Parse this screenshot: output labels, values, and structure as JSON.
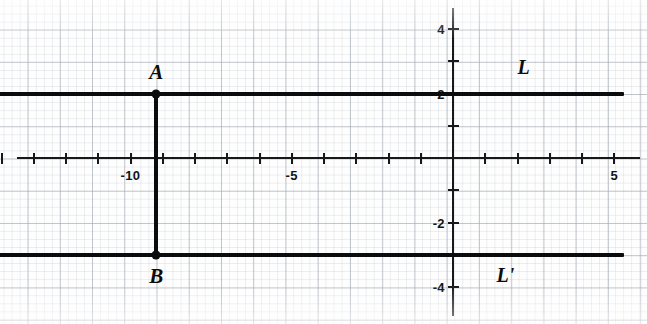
{
  "chart_data": {
    "type": "scatter",
    "title": "",
    "xlabel": "",
    "ylabel": "",
    "xlim": [
      -14.5,
      5.8
    ],
    "ylim": [
      -4.7,
      4.7
    ],
    "grid": true,
    "legend": "none",
    "axis": {
      "x_ticks": [
        -14,
        -13,
        -12,
        -11,
        -10,
        -9,
        -8,
        -7,
        -6,
        -5,
        -4,
        -3,
        -2,
        -1,
        0,
        1,
        2,
        3,
        4,
        5
      ],
      "y_ticks": [
        4,
        3,
        2,
        1,
        0,
        -1,
        -2,
        -3,
        -4
      ],
      "x_tick_labels": [
        {
          "value": -10,
          "text": "-10"
        },
        {
          "value": -5,
          "text": "-5"
        },
        {
          "value": 5,
          "text": "5"
        }
      ],
      "y_tick_labels": [
        {
          "value": 4,
          "text": "4"
        },
        {
          "value": 2,
          "text": "2"
        },
        {
          "value": -2,
          "text": "-2"
        },
        {
          "value": -4,
          "text": "-4"
        }
      ]
    },
    "lines": [
      {
        "name": "L",
        "label": "L",
        "orientation": "horizontal",
        "equation": "y = 2",
        "y": 2,
        "x_start": -14.4,
        "x_end": 5.3,
        "label_x": 2.0,
        "label_y": 2.75
      },
      {
        "name": "L-prime",
        "label": "L'",
        "orientation": "horizontal",
        "equation": "y = -3",
        "y": -3,
        "x_start": -14.4,
        "x_end": 5.3,
        "label_x": 1.35,
        "label_y": -3.7
      }
    ],
    "segments": [
      {
        "name": "AB",
        "orientation": "vertical",
        "x": -9.2,
        "y_start": 2,
        "y_end": -3
      }
    ],
    "points": [
      {
        "label": "A",
        "x": -9.2,
        "y": 2,
        "label_offset_y": 0.62
      },
      {
        "label": "B",
        "x": -9.2,
        "y": -3,
        "label_offset_y": -0.72
      }
    ]
  }
}
